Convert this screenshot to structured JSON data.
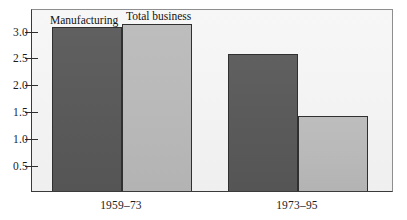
{
  "chart_data": {
    "type": "bar",
    "title": "",
    "subtitle": "",
    "xlabel": "",
    "ylabel": "",
    "categories": [
      "1959–73",
      "1973–95"
    ],
    "series": [
      {
        "name": "Manufacturing",
        "values": [
          3.05,
          2.55
        ],
        "color": "#5a5a5a"
      },
      {
        "name": "Total business",
        "values": [
          3.1,
          1.4
        ],
        "color": "#b9b9b9"
      }
    ],
    "ylim": [
      0,
      3.4
    ],
    "yticks": [
      0.5,
      1.0,
      1.5,
      2.0,
      2.5,
      3.0
    ],
    "ytick_labels": [
      "0.5",
      "1.0",
      "1.5",
      "2.0",
      "2.5",
      "3.0"
    ],
    "grid": false,
    "legend_position": "inside-top-left",
    "annotations": [
      {
        "text": "Manufacturing",
        "attached_to": "series-0"
      },
      {
        "text": "Total business",
        "attached_to": "series-1"
      }
    ]
  },
  "axis": {
    "y": {
      "ticks": [
        {
          "label": "3.0",
          "value": 3.0
        },
        {
          "label": "2.5",
          "value": 2.5
        },
        {
          "label": "2.0",
          "value": 2.0
        },
        {
          "label": "1.5",
          "value": 1.5
        },
        {
          "label": "1.0",
          "value": 1.0
        },
        {
          "label": "0.5",
          "value": 0.5
        }
      ]
    },
    "x": {
      "ticks": [
        {
          "label": "1959–73"
        },
        {
          "label": "1973–95"
        }
      ]
    }
  },
  "series_labels": {
    "manufacturing": "Manufacturing",
    "total_business": "Total business"
  },
  "colors": {
    "manufacturing": "#5a5a5a",
    "total_business": "#b9b9b9",
    "plot_background": "#f3f3f3",
    "axis": "#2e2e2e",
    "bar_outline": "#303030"
  }
}
